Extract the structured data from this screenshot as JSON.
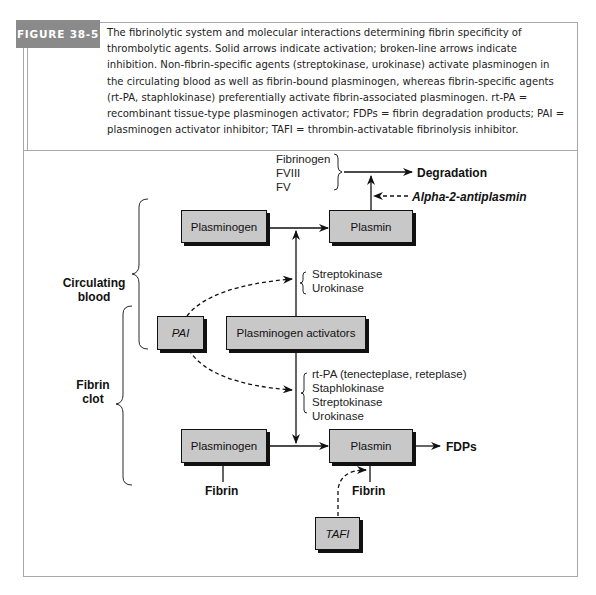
{
  "figure": {
    "label": "FIGURE 38-5",
    "caption": "The fibrinolytic system and molecular interactions determining fibrin specificity of thrombolytic agents. Solid arrows indicate activation; broken-line arrows indicate inhibition. Non-fibrin-specific agents (streptokinase, urokinase) activate plasminogen in the circulating blood as well as fibrin-bound plasminogen, whereas fibrin-specific agents (rt-PA, staphlokinase) preferentially activate fibrin-associated plasminogen. rt-PA = recombinant tissue-type plasminogen activator; FDPs = fibrin degradation products; PAI = plasminogen activator inhibitor; TAFI = thrombin-activatable fibrinolysis inhibitor."
  },
  "diagram": {
    "compartments": {
      "circulating": "Circulating blood",
      "circulating_line1": "Circulating",
      "circulating_line2": "blood",
      "clot_line1": "Fibrin",
      "clot_line2": "clot"
    },
    "boxes": {
      "plasminogen_top": "Plasminogen",
      "plasmin_top": "Plasmin",
      "pai": "PAI",
      "activators": "Plasminogen activators",
      "plasminogen_bottom": "Plasminogen",
      "plasmin_bottom": "Plasmin",
      "tafi": "TAFI"
    },
    "substrates": [
      "Fibrinogen",
      "FVIII",
      "FV"
    ],
    "degradation": "Degradation",
    "alpha2": "Alpha-2-antiplasmin",
    "circulating_agents": [
      "Streptokinase",
      "Urokinase"
    ],
    "clot_agents": [
      "rt-PA (tenecteplase, reteplase)",
      "Staphlokinase",
      "Streptokinase",
      "Urokinase"
    ],
    "fdps": "FDPs",
    "fibrin_left": "Fibrin",
    "fibrin_right": "Fibrin"
  }
}
